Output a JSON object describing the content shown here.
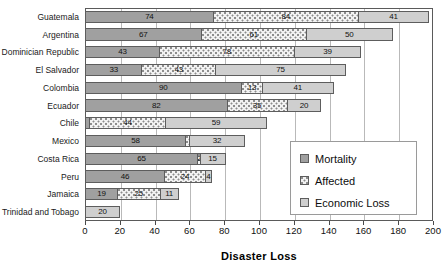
{
  "chart_data": {
    "type": "bar",
    "orientation": "horizontal",
    "stacked": true,
    "title": "",
    "xlabel": "Disaster Loss",
    "ylabel": "",
    "xlim": [
      0,
      200
    ],
    "xticks": [
      0,
      20,
      40,
      60,
      80,
      100,
      120,
      140,
      160,
      180,
      200
    ],
    "grid": true,
    "legend_position": "lower-right",
    "categories": [
      "Guatemala",
      "Argentina",
      "Dominician Republic",
      "El Salvador",
      "Colombia",
      "Ecuador",
      "Chile",
      "Mexico",
      "Costa Rica",
      "Peru",
      "Jamaica",
      "Trinidad and Tobago"
    ],
    "series": [
      {
        "name": "Mortality",
        "color": "#a0a0a0",
        "pattern": "solid-dark-gray",
        "values": [
          74,
          67,
          43,
          33,
          90,
          82,
          3,
          58,
          65,
          46,
          19,
          0
        ]
      },
      {
        "name": "Affected",
        "color": "#f2f2f2",
        "pattern": "dotted",
        "values": [
          84,
          61,
          78,
          43,
          13,
          35,
          44,
          3,
          2,
          24,
          25,
          0
        ]
      },
      {
        "name": "Economic Loss",
        "color": "#cfcfcf",
        "pattern": "solid-light-gray",
        "values": [
          41,
          50,
          39,
          75,
          41,
          20,
          59,
          32,
          15,
          4,
          11,
          20
        ]
      }
    ],
    "bar_labels": [
      [
        {
          "value": 74,
          "shown": true
        },
        {
          "value": 84,
          "shown": true
        },
        {
          "value": 41,
          "shown": true
        }
      ],
      [
        {
          "value": 67,
          "shown": true
        },
        {
          "value": 61,
          "shown": true
        },
        {
          "value": 50,
          "shown": true
        }
      ],
      [
        {
          "value": 43,
          "shown": true
        },
        {
          "value": 78,
          "shown": true
        },
        {
          "value": 39,
          "shown": true
        }
      ],
      [
        {
          "value": 33,
          "shown": true
        },
        {
          "value": 43,
          "shown": true
        },
        {
          "value": 75,
          "shown": true
        }
      ],
      [
        {
          "value": 90,
          "shown": true
        },
        {
          "value": 13,
          "shown": true
        },
        {
          "value": 41,
          "shown": true
        }
      ],
      [
        {
          "value": 82,
          "shown": true
        },
        {
          "value": 35,
          "shown": true
        },
        {
          "value": 20,
          "shown": true
        }
      ],
      [
        {
          "value": 3,
          "shown": false
        },
        {
          "value": 44,
          "shown": true
        },
        {
          "value": 59,
          "shown": true
        }
      ],
      [
        {
          "value": 58,
          "shown": true
        },
        {
          "value": 3,
          "shown": false
        },
        {
          "value": 32,
          "shown": true
        }
      ],
      [
        {
          "value": 65,
          "shown": true
        },
        {
          "value": 2,
          "shown": true
        },
        {
          "value": 15,
          "shown": true
        }
      ],
      [
        {
          "value": 46,
          "shown": true
        },
        {
          "value": 24,
          "shown": true
        },
        {
          "value": 4,
          "shown": true
        }
      ],
      [
        {
          "value": 19,
          "shown": true
        },
        {
          "value": 25,
          "shown": true
        },
        {
          "value": 11,
          "shown": true
        }
      ],
      [
        {
          "value": 0,
          "shown": false
        },
        {
          "value": 0,
          "shown": false
        },
        {
          "value": 20,
          "shown": true
        }
      ]
    ]
  },
  "legend": {
    "items": [
      {
        "label": "Mortality"
      },
      {
        "label": "Affected"
      },
      {
        "label": "Economic Loss"
      }
    ]
  }
}
